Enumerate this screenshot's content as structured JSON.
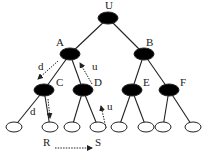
{
  "diagram": {
    "type": "binary-tree-traversal",
    "nodes": [
      {
        "id": "U",
        "label": "U",
        "x": 108,
        "y": 18,
        "kind": "internal",
        "lx": 105,
        "ly": 9
      },
      {
        "id": "A",
        "label": "A",
        "x": 70,
        "y": 54,
        "kind": "internal",
        "lx": 56,
        "ly": 46
      },
      {
        "id": "B",
        "label": "B",
        "x": 144,
        "y": 54,
        "kind": "internal",
        "lx": 146,
        "ly": 46
      },
      {
        "id": "C",
        "label": "C",
        "x": 44,
        "y": 90,
        "kind": "internal",
        "lx": 56,
        "ly": 86
      },
      {
        "id": "D",
        "label": "D",
        "x": 83,
        "y": 90,
        "kind": "internal",
        "lx": 94,
        "ly": 86
      },
      {
        "id": "E",
        "label": "E",
        "x": 132,
        "y": 90,
        "kind": "internal",
        "lx": 143,
        "ly": 86
      },
      {
        "id": "F",
        "label": "F",
        "x": 169,
        "y": 90,
        "kind": "internal",
        "lx": 180,
        "ly": 86
      },
      {
        "id": "L1",
        "label": "",
        "x": 14,
        "y": 127,
        "kind": "leaf"
      },
      {
        "id": "L2",
        "label": "",
        "x": 50,
        "y": 127,
        "kind": "leaf"
      },
      {
        "id": "L3",
        "label": "",
        "x": 72,
        "y": 127,
        "kind": "leaf"
      },
      {
        "id": "L4",
        "label": "",
        "x": 98,
        "y": 127,
        "kind": "leaf"
      },
      {
        "id": "L5",
        "label": "",
        "x": 119,
        "y": 127,
        "kind": "leaf"
      },
      {
        "id": "L6",
        "label": "",
        "x": 146,
        "y": 127,
        "kind": "leaf"
      },
      {
        "id": "L7",
        "label": "",
        "x": 163,
        "y": 127,
        "kind": "leaf"
      },
      {
        "id": "L8",
        "label": "",
        "x": 193,
        "y": 127,
        "kind": "leaf"
      }
    ],
    "edges": [
      [
        "U",
        "A"
      ],
      [
        "U",
        "B"
      ],
      [
        "A",
        "C"
      ],
      [
        "A",
        "D"
      ],
      [
        "B",
        "E"
      ],
      [
        "B",
        "F"
      ],
      [
        "C",
        "L1"
      ],
      [
        "C",
        "L2"
      ],
      [
        "D",
        "L3"
      ],
      [
        "D",
        "L4"
      ],
      [
        "E",
        "L5"
      ],
      [
        "E",
        "L6"
      ],
      [
        "F",
        "L7"
      ],
      [
        "F",
        "L8"
      ]
    ],
    "traversal_arrows": [
      {
        "label": "d",
        "x1": 58,
        "y1": 61,
        "x2": 38,
        "y2": 79,
        "lx": 38,
        "ly": 70
      },
      {
        "label": "d",
        "x1": 48,
        "y1": 99,
        "x2": 50,
        "y2": 118,
        "lx": 30,
        "ly": 115
      },
      {
        "label": "u",
        "x1": 92,
        "y1": 84,
        "x2": 80,
        "y2": 63,
        "lx": 92,
        "ly": 70
      },
      {
        "label": "u",
        "x1": 106,
        "y1": 128,
        "x2": 101,
        "y2": 106,
        "lx": 107,
        "ly": 110
      },
      {
        "label": "",
        "x1": 55,
        "y1": 148,
        "x2": 92,
        "y2": 148,
        "lx": 0,
        "ly": 0
      }
    ],
    "annotations": [
      {
        "label": "R",
        "x": 43,
        "y": 146
      },
      {
        "label": "S",
        "x": 95,
        "y": 146
      }
    ],
    "colors": {
      "internal_fill": "#000000",
      "leaf_fill": "#ffffff",
      "stroke": "#222222"
    }
  }
}
